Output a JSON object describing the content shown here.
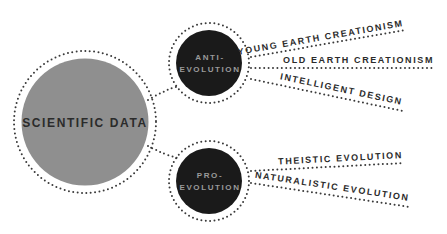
{
  "diagram": {
    "colors": {
      "background": "#ffffff",
      "main_fill": "#8f8f8f",
      "node_fill": "#1a1a1a",
      "dots": "#3a3a3a",
      "dark_text": "#2b2b2b",
      "node_text": "#9a9a9a"
    },
    "root": {
      "label": "SCIENTIFIC DATA"
    },
    "nodes": [
      {
        "id": "anti",
        "label_line1": "ANTI-",
        "label_line2": "EVOLUTION",
        "branches": [
          {
            "label": "YOUNG EARTH CREATIONISM"
          },
          {
            "label": "OLD EARTH CREATIONISM"
          },
          {
            "label": "INTELLIGENT DESIGN"
          }
        ]
      },
      {
        "id": "pro",
        "label_line1": "PRO-",
        "label_line2": "EVOLUTION",
        "branches": [
          {
            "label": "THEISTIC EVOLUTION"
          },
          {
            "label": "NATURALISTIC EVOLUTION"
          }
        ]
      }
    ]
  }
}
